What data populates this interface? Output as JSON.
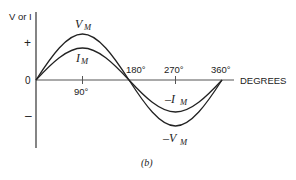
{
  "diagram": {
    "caption": "(b)",
    "y_axis": {
      "label": "V or I",
      "plus_label": "+",
      "minus_label": "–",
      "zero_label": "0"
    },
    "x_axis": {
      "label": "DEGREES",
      "ticks": [
        "90°",
        "180°",
        "270°",
        "360°"
      ]
    },
    "curves": [
      {
        "name": "voltage",
        "peak_label": "V",
        "peak_sub": "M",
        "trough_label": "–V",
        "trough_sub": "M",
        "amplitude_px": 46
      },
      {
        "name": "current",
        "peak_label": "I",
        "peak_sub": "M",
        "trough_label": "–I",
        "trough_sub": "M",
        "amplitude_px": 32
      }
    ],
    "colors": {
      "line": "#222222",
      "axis": "#555555",
      "background": "#ffffff"
    }
  }
}
